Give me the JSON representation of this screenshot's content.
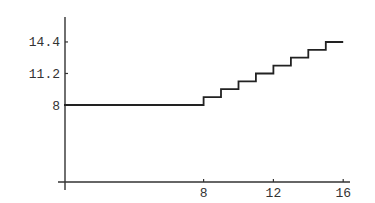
{
  "chart_data": {
    "type": "line",
    "title": "",
    "xlabel": "",
    "ylabel": "",
    "xlim": [
      0,
      16.5
    ],
    "ylim": [
      0,
      15.5
    ],
    "grid": false,
    "legend": null,
    "x_ticks": [
      8,
      12,
      16
    ],
    "y_ticks": [
      8,
      11.2,
      14.4
    ],
    "x_tick_labels": [
      "8",
      "12",
      "16"
    ],
    "y_tick_labels": [
      "8",
      "11.2",
      "14.4"
    ],
    "series": [
      {
        "name": "step function",
        "style": "step",
        "color": "#222222",
        "points": [
          [
            0,
            8
          ],
          [
            8,
            8
          ],
          [
            8,
            8.8
          ],
          [
            9,
            8.8
          ],
          [
            9,
            9.6
          ],
          [
            10,
            9.6
          ],
          [
            10,
            10.4
          ],
          [
            11,
            10.4
          ],
          [
            11,
            11.2
          ],
          [
            12,
            11.2
          ],
          [
            12,
            12.0
          ],
          [
            13,
            12.0
          ],
          [
            13,
            12.8
          ],
          [
            14,
            12.8
          ],
          [
            14,
            13.6
          ],
          [
            15,
            13.6
          ],
          [
            15,
            14.4
          ],
          [
            16,
            14.4
          ]
        ]
      }
    ]
  }
}
